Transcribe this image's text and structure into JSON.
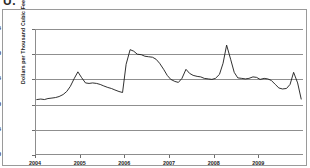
{
  "figure": {
    "label": "U.",
    "background_color": "#ffffff",
    "line_color": "#1a1a1a",
    "grid_color": "#8f8f8f",
    "axis_color": "#8d8d8d"
  },
  "chart_data": {
    "type": "line",
    "title": "",
    "subtitle": "",
    "xlabel": "",
    "ylabel": "Dollars per Thousand Cubic Feet",
    "ylim": [
      0,
      25
    ],
    "yticks": [
      0,
      5,
      10,
      15,
      20,
      25
    ],
    "xlim": [
      2004.0,
      2010.0
    ],
    "xticks": [
      2004,
      2005,
      2006,
      2007,
      2008,
      2009
    ],
    "xtick_labels": [
      "2004",
      "2005",
      "2006",
      "2007",
      "2008",
      "2009"
    ],
    "grid": "horizontal",
    "legend": "none",
    "markers": "none",
    "series": [
      {
        "name": "Natural gas price",
        "color": "#1a1a1a",
        "x": [
          2004.04,
          2004.13,
          2004.21,
          2004.29,
          2004.38,
          2004.46,
          2004.54,
          2004.63,
          2004.71,
          2004.79,
          2004.88,
          2004.96,
          2005.04,
          2005.13,
          2005.21,
          2005.29,
          2005.38,
          2005.46,
          2005.54,
          2005.63,
          2005.71,
          2005.79,
          2005.88,
          2005.96,
          2006.04,
          2006.13,
          2006.21,
          2006.29,
          2006.38,
          2006.46,
          2006.54,
          2006.63,
          2006.71,
          2006.79,
          2006.88,
          2006.96,
          2007.04,
          2007.13,
          2007.21,
          2007.29,
          2007.38,
          2007.46,
          2007.54,
          2007.63,
          2007.71,
          2007.79,
          2007.88,
          2007.96,
          2008.04,
          2008.13,
          2008.21,
          2008.29,
          2008.38,
          2008.46,
          2008.54,
          2008.63,
          2008.71,
          2008.79,
          2008.88,
          2008.96,
          2009.04,
          2009.13,
          2009.21,
          2009.29,
          2009.38,
          2009.46,
          2009.54,
          2009.63,
          2009.71,
          2009.79,
          2009.88,
          2009.96
        ],
        "y": [
          11.0,
          11.1,
          11.0,
          11.2,
          11.3,
          11.4,
          11.6,
          12.0,
          12.6,
          13.6,
          15.2,
          16.5,
          15.4,
          14.3,
          14.2,
          14.3,
          14.2,
          14.0,
          13.7,
          13.4,
          13.2,
          12.9,
          12.6,
          12.4,
          18.0,
          20.9,
          20.6,
          20.0,
          19.9,
          19.6,
          19.5,
          19.4,
          19.0,
          18.2,
          17.0,
          15.8,
          15.0,
          14.6,
          14.4,
          15.2,
          17.0,
          16.2,
          15.8,
          15.6,
          15.5,
          15.2,
          15.1,
          15.0,
          15.2,
          16.0,
          18.2,
          21.8,
          19.0,
          16.4,
          15.3,
          15.2,
          15.1,
          15.2,
          15.5,
          15.4,
          15.0,
          15.2,
          15.1,
          14.8,
          14.0,
          13.3,
          13.1,
          13.2,
          14.0,
          16.4,
          14.3,
          11.1
        ]
      }
    ]
  }
}
